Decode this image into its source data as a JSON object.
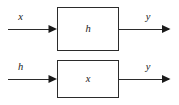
{
  "figure": {
    "kind": "block-diagram",
    "background_color": "#ffffff",
    "line_color": "#2b2b2b",
    "text_color": "#1a1a1a"
  },
  "systems": [
    {
      "id": "upper",
      "input_label": "x",
      "block_label": "h",
      "output_label": "y"
    },
    {
      "id": "lower",
      "input_label": "h",
      "block_label": "x",
      "output_label": "y"
    }
  ]
}
